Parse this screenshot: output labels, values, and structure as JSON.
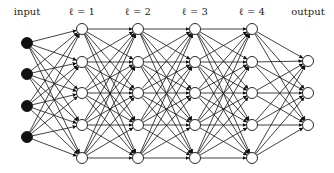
{
  "labels": {
    "input": "input",
    "l1": "ℓ = 1",
    "l2": "ℓ = 2",
    "l3": "ℓ = 3",
    "l4": "ℓ = 4",
    "output": "output"
  },
  "layers": [
    {
      "name": "input",
      "x": 27,
      "ys": [
        43,
        74,
        106,
        137
      ],
      "filled": true
    },
    {
      "name": "l1",
      "x": 82,
      "ys": [
        29,
        62,
        93,
        125,
        158
      ],
      "filled": false
    },
    {
      "name": "l2",
      "x": 138,
      "ys": [
        29,
        62,
        93,
        125,
        158
      ],
      "filled": false
    },
    {
      "name": "l3",
      "x": 195,
      "ys": [
        29,
        62,
        93,
        125,
        158
      ],
      "filled": false
    },
    {
      "name": "l4",
      "x": 252,
      "ys": [
        29,
        62,
        93,
        125,
        158
      ],
      "filled": false
    },
    {
      "name": "output",
      "x": 308,
      "ys": [
        61,
        93,
        125
      ],
      "filled": false
    }
  ],
  "colors": {
    "stroke": "#111111",
    "fill_input": "#111111",
    "fill_hidden": "#ffffff"
  }
}
